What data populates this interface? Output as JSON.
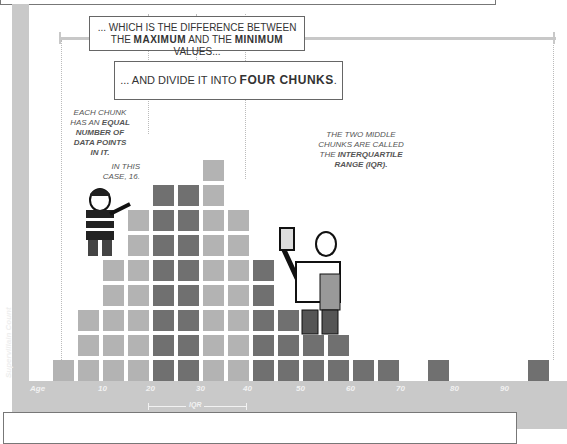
{
  "callouts": {
    "range_line1": "... WHICH IS THE DIFFERENCE BETWEEN",
    "range_line2_pre": "THE ",
    "range_max": "MAXIMUM",
    "range_mid": " AND THE ",
    "range_min": "MINIMUM",
    "range_post": " VALUES...",
    "chunks_pre": "... AND DIVIDE IT INTO ",
    "chunks_bold": "FOUR CHUNKS",
    "chunks_post": "."
  },
  "notes": {
    "left_line1": "EACH CHUNK",
    "left_line2_pre": "HAS AN ",
    "left_line2_bold": "EQUAL",
    "left_line3": "NUMBER OF",
    "left_line4": "DATA POINTS",
    "left_line5": "IN IT.",
    "left_case1": "IN THIS",
    "left_case2": "CASE, 16.",
    "right_line1": "THE TWO MIDDLE",
    "right_line2": "CHUNKS ARE CALLED",
    "right_line3_pre": "THE ",
    "right_line3_bold": "INTERQUARTILE",
    "right_line4": "RANGE (IQR)."
  },
  "colors": {
    "light_bar": "#b3b3b3",
    "dark_bar": "#707070",
    "axis_band": "#c9c9c9",
    "range_line": "#c8c8c8"
  },
  "chart_data": {
    "type": "bar",
    "title": "",
    "xlabel": "Age",
    "ylabel": "Supervillain Count",
    "x_tick_labels": [
      "10",
      "20",
      "30",
      "40",
      "50",
      "60",
      "70",
      "80",
      "90"
    ],
    "bin_width_years": 5,
    "bins": [
      "0-5",
      "5-10",
      "10-15",
      "15-20",
      "20-25",
      "25-30",
      "30-35",
      "35-40",
      "40-45",
      "45-50",
      "50-55",
      "55-60",
      "60-65",
      "65-70",
      "70-75",
      "75-80",
      "80-85",
      "85-90",
      "90-95",
      "95-100"
    ],
    "values": [
      1,
      3,
      5,
      7,
      8,
      8,
      9,
      7,
      5,
      3,
      2,
      2,
      1,
      1,
      0,
      1,
      0,
      0,
      0,
      1
    ],
    "quartile_shading": [
      "light",
      "light",
      "light",
      "light",
      "dark",
      "dark",
      "light",
      "light",
      "dark",
      "dark",
      "dark",
      "dark",
      "dark",
      "dark",
      "dark",
      "dark",
      "dark",
      "dark",
      "dark",
      "dark"
    ],
    "total_points": 64,
    "points_per_chunk": 16,
    "annotations": [
      "IQR (spans 20 to 40)",
      "range bracket from minimum to maximum"
    ],
    "grid": false,
    "legend": null
  },
  "axis": {
    "x_title": "Age",
    "y_title": "Supervillain Count",
    "iqr_label": "IQR"
  }
}
